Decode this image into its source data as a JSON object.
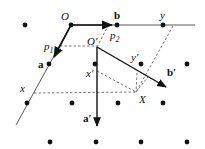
{
  "diagram": {
    "title": "",
    "colors": {
      "ink": "#111111",
      "dash": "#555555",
      "background": "#ffffff"
    },
    "labels": {
      "O": "O",
      "b": "b",
      "y": "y",
      "p1": "p",
      "p1_sub": "1",
      "p2": "p",
      "p2_sub": "2",
      "O_prime": "O′",
      "a": "a",
      "x": "x",
      "y_prime": "y′",
      "x_prime": "x′",
      "b_prime": "b′",
      "X": "X",
      "a_prime": "a′"
    },
    "lattice_points": [
      [
        25,
        25
      ],
      [
        71,
        25
      ],
      [
        117,
        25
      ],
      [
        163,
        25
      ],
      [
        49,
        64
      ],
      [
        95,
        64
      ],
      [
        141,
        64
      ],
      [
        187,
        64
      ],
      [
        27,
        103
      ],
      [
        72,
        103
      ],
      [
        118,
        103
      ],
      [
        163,
        103
      ],
      [
        50,
        142
      ],
      [
        96,
        142
      ],
      [
        141,
        142
      ],
      [
        187,
        142
      ]
    ]
  }
}
